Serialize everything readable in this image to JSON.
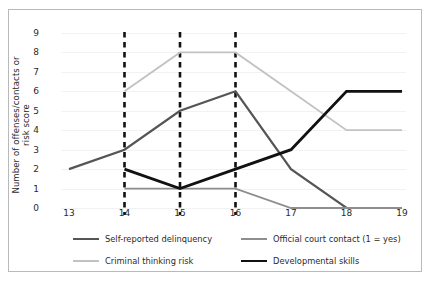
{
  "chart_data": {
    "type": "line",
    "title": "",
    "xlabel": "",
    "ylabel": "Number of offenses/contacts or risk score",
    "x": [
      13,
      14,
      15,
      16,
      17,
      18,
      19
    ],
    "xticklabels": [
      "13",
      "14",
      "15",
      "16",
      "17",
      "18",
      "19"
    ],
    "yticklabels": [
      "0",
      "1",
      "2",
      "3",
      "4",
      "5",
      "6",
      "7",
      "8",
      "9"
    ],
    "xlim": [
      13,
      19
    ],
    "ylim": [
      0,
      9
    ],
    "grid": true,
    "legend_position": "bottom",
    "annotations": {
      "vertical_dashed_lines": [
        14,
        15,
        16
      ],
      "vertical_dashed_color": "#111111"
    },
    "series": [
      {
        "name": "Self-reported delinquency",
        "color": "#555555",
        "width": 2.2,
        "x": [
          13,
          14,
          15,
          16,
          17,
          18,
          19
        ],
        "values": [
          2,
          3,
          5,
          6,
          2,
          0,
          0
        ]
      },
      {
        "name": "Official court contact (1 = yes)",
        "color": "#8e8e8e",
        "width": 1.8,
        "x": [
          14,
          15,
          16,
          17,
          18,
          19
        ],
        "values": [
          1,
          1,
          1,
          0,
          0,
          0
        ]
      },
      {
        "name": "Criminal thinking risk",
        "color": "#c2c2c2",
        "width": 1.8,
        "x": [
          14,
          15,
          16,
          17,
          18,
          19
        ],
        "values": [
          6,
          8,
          8,
          6,
          4,
          4
        ]
      },
      {
        "name": "Developmental skills",
        "color": "#111111",
        "width": 2.8,
        "x": [
          14,
          15,
          16,
          17,
          18,
          19
        ],
        "values": [
          2,
          1,
          2,
          3,
          6,
          6
        ]
      }
    ]
  }
}
